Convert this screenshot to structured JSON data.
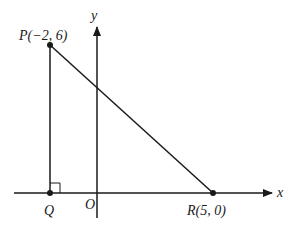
{
  "diagram": {
    "type": "coordinate-geometry",
    "axes": {
      "x_label": "x",
      "y_label": "y",
      "origin_label": "O"
    },
    "points": {
      "P": {
        "label": "P(−2, 6)",
        "coords": [
          -2,
          6
        ]
      },
      "Q": {
        "label": "Q",
        "coords": [
          -2,
          0
        ]
      },
      "R": {
        "label": "R(5, 0)",
        "coords": [
          5,
          0
        ]
      }
    },
    "segments": [
      "PQ",
      "QR",
      "PR"
    ],
    "right_angle_at": "Q",
    "colors": {
      "ink": "#1a1a1a",
      "background": "#ffffff"
    }
  }
}
